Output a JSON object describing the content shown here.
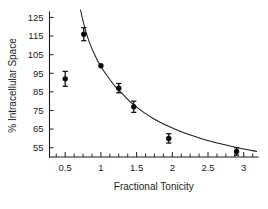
{
  "chart_data": {
    "type": "scatter",
    "title": "",
    "xlabel": "Fractional Tonicity",
    "ylabel": "% Intracellular Space",
    "xlim": [
      0.28,
      3.2
    ],
    "ylim": [
      50,
      129
    ],
    "grid": false,
    "legend": null,
    "x_ticks": [
      {
        "value": 0.5,
        "label": "0.5"
      },
      {
        "value": 1,
        "label": "1"
      },
      {
        "value": 1.5,
        "label": "1.5"
      },
      {
        "value": 2,
        "label": "2"
      },
      {
        "value": 2.5,
        "label": "2.5"
      },
      {
        "value": 3,
        "label": "3"
      }
    ],
    "x_minor_ticks": [
      0.375,
      0.625,
      0.75,
      0.875,
      1.125,
      1.25,
      1.375,
      1.625,
      1.75,
      1.875,
      2.125,
      2.25,
      2.375,
      2.625,
      2.75,
      2.875,
      3.125
    ],
    "y_ticks": [
      {
        "value": 125,
        "label": "125"
      },
      {
        "value": 115,
        "label": "115"
      },
      {
        "value": 105,
        "label": "105"
      },
      {
        "value": 95,
        "label": "95"
      },
      {
        "value": 85,
        "label": "85"
      },
      {
        "value": 75,
        "label": "75"
      },
      {
        "value": 65,
        "label": "65"
      },
      {
        "value": 55,
        "label": "55"
      }
    ],
    "series": [
      {
        "name": "Measured intracellular space",
        "marker": "filled-circle",
        "color": "#0d0d0d",
        "points": [
          {
            "x": 0.5,
            "y": 92,
            "yerr": 4.0
          },
          {
            "x": 0.76,
            "y": 116,
            "yerr": 3.5
          },
          {
            "x": 1.0,
            "y": 99,
            "yerr": 0.0
          },
          {
            "x": 1.25,
            "y": 87,
            "yerr": 2.5
          },
          {
            "x": 1.46,
            "y": 77,
            "yerr": 3.0
          },
          {
            "x": 1.95,
            "y": 60,
            "yerr": 2.5
          },
          {
            "x": 2.9,
            "y": 53,
            "yerr": 2.0
          }
        ]
      }
    ],
    "fit_curve": {
      "name": "Fitted hyperbolic curve",
      "color": "#1c1c1c",
      "points": [
        {
          "x": 0.715,
          "y": 129.0
        },
        {
          "x": 0.75,
          "y": 123.0
        },
        {
          "x": 0.8,
          "y": 116.0
        },
        {
          "x": 0.85,
          "y": 110.5
        },
        {
          "x": 0.9,
          "y": 106.0
        },
        {
          "x": 0.95,
          "y": 102.0
        },
        {
          "x": 1.0,
          "y": 98.5
        },
        {
          "x": 1.1,
          "y": 93.0
        },
        {
          "x": 1.2,
          "y": 88.0
        },
        {
          "x": 1.3,
          "y": 84.0
        },
        {
          "x": 1.4,
          "y": 80.0
        },
        {
          "x": 1.5,
          "y": 76.8
        },
        {
          "x": 1.6,
          "y": 74.0
        },
        {
          "x": 1.75,
          "y": 70.3
        },
        {
          "x": 1.9,
          "y": 67.3
        },
        {
          "x": 2.05,
          "y": 64.8
        },
        {
          "x": 2.2,
          "y": 62.5
        },
        {
          "x": 2.4,
          "y": 60.0
        },
        {
          "x": 2.6,
          "y": 57.8
        },
        {
          "x": 2.8,
          "y": 56.0
        },
        {
          "x": 3.0,
          "y": 54.3
        },
        {
          "x": 3.18,
          "y": 53.0
        }
      ]
    }
  }
}
